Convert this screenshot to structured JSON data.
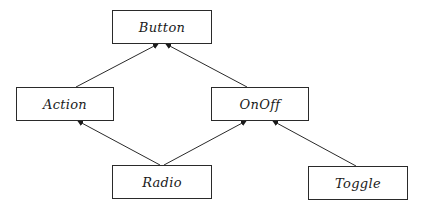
{
  "diagram": {
    "type": "class-hierarchy",
    "nodes": [
      {
        "id": "button",
        "label": "Button",
        "x": 112,
        "y": 10,
        "w": 100,
        "h": 34
      },
      {
        "id": "action",
        "label": "Action",
        "x": 16,
        "y": 87,
        "w": 98,
        "h": 34
      },
      {
        "id": "onoff",
        "label": "OnOff",
        "x": 211,
        "y": 87,
        "w": 98,
        "h": 34
      },
      {
        "id": "radio",
        "label": "Radio",
        "x": 112,
        "y": 165,
        "w": 100,
        "h": 34
      },
      {
        "id": "toggle",
        "label": "Toggle",
        "x": 308,
        "y": 166,
        "w": 100,
        "h": 34
      }
    ],
    "edges": [
      {
        "from": "action",
        "to": "button",
        "x1": 76,
        "y1": 87,
        "x2": 158,
        "y2": 44
      },
      {
        "from": "onoff",
        "to": "button",
        "x1": 247,
        "y1": 87,
        "x2": 166,
        "y2": 44
      },
      {
        "from": "radio",
        "to": "action",
        "x1": 160,
        "y1": 165,
        "x2": 78,
        "y2": 121
      },
      {
        "from": "radio",
        "to": "onoff",
        "x1": 164,
        "y1": 165,
        "x2": 246,
        "y2": 121
      },
      {
        "from": "toggle",
        "to": "onoff",
        "x1": 356,
        "y1": 166,
        "x2": 273,
        "y2": 121
      }
    ],
    "colors": {
      "stroke": "#2a2a2a",
      "background": "#ffffff"
    }
  }
}
